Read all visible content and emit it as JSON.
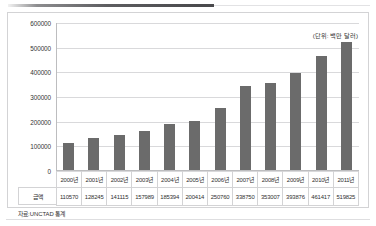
{
  "figure": {
    "unit_note": "(단위: 백만 달러)",
    "source_note": "자료:UNCTAD 통계",
    "row_header": "금액",
    "bar_color": "#6b6b6b",
    "grid_color": "#d9d9db",
    "border_color": "#d3d3d5"
  },
  "chart_data": {
    "type": "bar",
    "title": "",
    "subtitle": "",
    "xlabel": "",
    "ylabel": "",
    "unit": "(단위: 백만 달러)",
    "source": "자료:UNCTAD 통계",
    "categories": [
      "2000년",
      "2001년",
      "2002년",
      "2003년",
      "2004년",
      "2005년",
      "2006년",
      "2007년",
      "2008년",
      "2009년",
      "2010년",
      "2011년"
    ],
    "values": [
      110570,
      128245,
      141115,
      157989,
      185394,
      200414,
      250760,
      338750,
      353007,
      393876,
      461417,
      519825
    ],
    "series": [
      {
        "name": "금액",
        "values": [
          110570,
          128245,
          141115,
          157989,
          185394,
          200414,
          250760,
          338750,
          353007,
          393876,
          461417,
          519825
        ]
      }
    ],
    "ylim": [
      0,
      600000
    ],
    "yticks": [
      0,
      100000,
      200000,
      300000,
      400000,
      500000,
      600000
    ],
    "ytick_labels": [
      "0",
      "100000",
      "200000",
      "300000",
      "400000",
      "500000",
      "600000"
    ],
    "grid": true,
    "legend": false,
    "legend_position": "none"
  }
}
